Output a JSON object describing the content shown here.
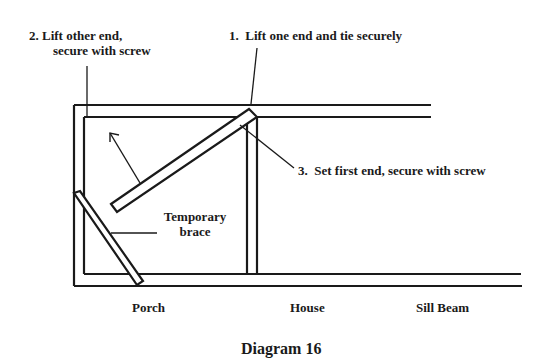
{
  "diagram": {
    "caption": "Diagram 16",
    "steps": [
      {
        "number": "1.",
        "text": "Lift one end and tie securely",
        "full": "1.  Lift one end and tie securely"
      },
      {
        "number": "2.",
        "line1": "2.  Lift other end,",
        "line2": "secure with screw"
      },
      {
        "number": "3.",
        "text": "Set first end, secure with screw",
        "full": "3.  Set first end, secure with screw"
      }
    ],
    "brace_label": {
      "line1": "Temporary",
      "line2": "brace"
    },
    "bottom_labels": {
      "porch": "Porch",
      "house": "House",
      "sill_beam": "Sill Beam"
    },
    "colors": {
      "line": "#1a1a1a",
      "background": "#ffffff"
    }
  }
}
